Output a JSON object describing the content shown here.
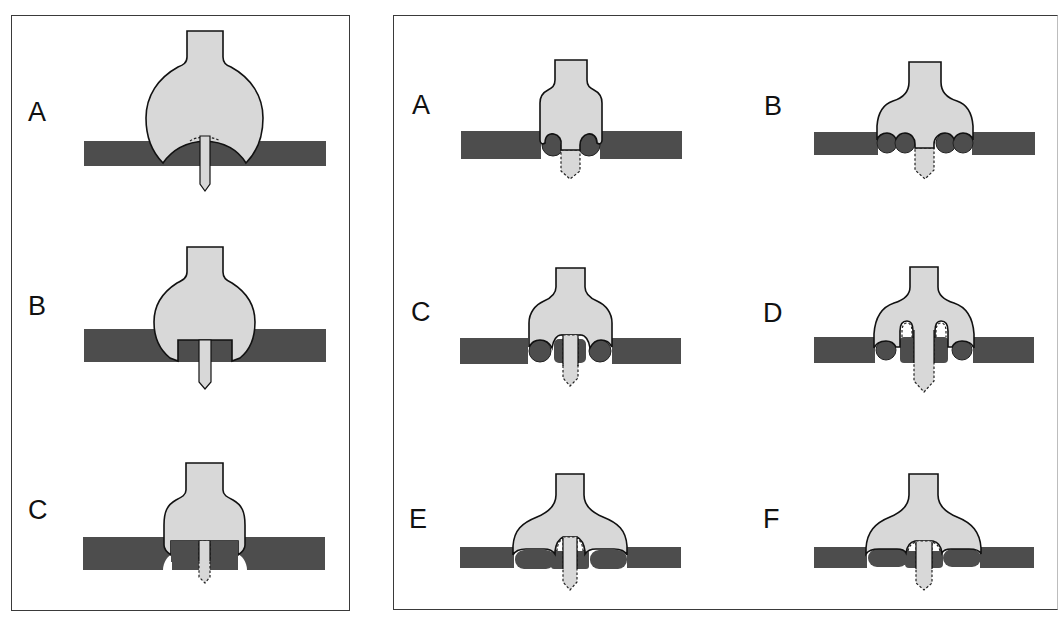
{
  "figure": {
    "left_panel": {
      "labels": [
        "A",
        "B",
        "C"
      ]
    },
    "right_panel": {
      "labels": [
        "A",
        "B",
        "C",
        "D",
        "E",
        "F"
      ]
    },
    "colors": {
      "plate": "#4d4d4d",
      "body": "#d8d8d8",
      "outline": "#111111",
      "border": "#3a3a3a"
    }
  }
}
